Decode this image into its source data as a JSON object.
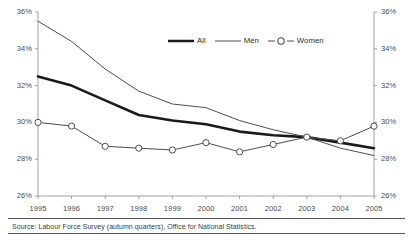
{
  "chart_data": {
    "type": "line",
    "title": "",
    "xlabel": "",
    "ylabel": "",
    "categories": [
      1995,
      1996,
      1997,
      1998,
      1999,
      2000,
      2001,
      2002,
      2003,
      2004,
      2005
    ],
    "x": [
      "1995",
      "1996",
      "1997",
      "1998",
      "1999",
      "2000",
      "2001",
      "2002",
      "2003",
      "2004",
      "2005"
    ],
    "series": [
      {
        "name": "All",
        "style": "thick-line",
        "marker": "none",
        "color": "#1a1a1a",
        "values": [
          32.5,
          32.0,
          31.2,
          30.4,
          30.1,
          29.9,
          29.5,
          29.3,
          29.2,
          28.9,
          28.6
        ]
      },
      {
        "name": "Men",
        "style": "thin-line",
        "marker": "none",
        "color": "#4d4d4d",
        "values": [
          35.5,
          34.4,
          32.9,
          31.7,
          31.0,
          30.8,
          30.1,
          29.6,
          29.2,
          28.6,
          28.2
        ]
      },
      {
        "name": "Women",
        "style": "thin-line-marker",
        "marker": "open-circle",
        "color": "#4d4d4d",
        "values": [
          30.0,
          29.8,
          28.7,
          28.6,
          28.5,
          28.9,
          28.4,
          28.8,
          29.2,
          29.0,
          29.8
        ]
      }
    ],
    "ylim": [
      26,
      36
    ],
    "yticks": [
      26,
      28,
      30,
      32,
      34,
      36
    ],
    "ytick_labels": [
      "26%",
      "28%",
      "30%",
      "32%",
      "34%",
      "36%"
    ],
    "ytick_labels_right": [
      "26%",
      "28%",
      "30%",
      "32%",
      "34%",
      "36%"
    ],
    "y_axis_unit": "%",
    "dual_y_axis": true,
    "grid": false,
    "legend_position": "top-center",
    "legend_entries": [
      "All",
      "Men",
      "Women"
    ]
  },
  "footer": {
    "source": "Source:  Labour Force Survey (autumn quarters), Office for National Statistics."
  }
}
